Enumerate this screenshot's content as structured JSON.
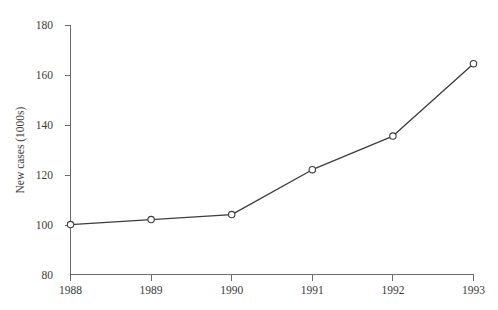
{
  "chart_data": {
    "type": "line",
    "title": "",
    "subtitle": "",
    "xlabel": "",
    "ylabel": "New cases (1000s)",
    "categories": [
      "1988",
      "1989",
      "1990",
      "1991",
      "1992",
      "1993"
    ],
    "x": [
      1988,
      1989,
      1990,
      1991,
      1992,
      1993
    ],
    "values": [
      100,
      102,
      104,
      122,
      135.5,
      164.5
    ],
    "series": [
      {
        "name": "New cases",
        "values": [
          100,
          102,
          104,
          122,
          135.5,
          164.5
        ]
      }
    ],
    "xlim": [
      1988,
      1993
    ],
    "ylim": [
      80,
      180
    ],
    "ytick_labels": [
      "80",
      "100",
      "120",
      "140",
      "160",
      "180"
    ],
    "ytick_values": [
      80,
      100,
      120,
      140,
      160,
      180
    ],
    "xtick_labels": [
      "1988",
      "1989",
      "1990",
      "1991",
      "1992",
      "1993"
    ],
    "grid": false,
    "legend": false,
    "legend_position": "none",
    "marker": "open-circle",
    "line_color": "#3c3c3c",
    "marker_face_color": "#ffffff",
    "axis_color": "#6b6b6b",
    "background_color": "#ffffff",
    "annotations": []
  }
}
